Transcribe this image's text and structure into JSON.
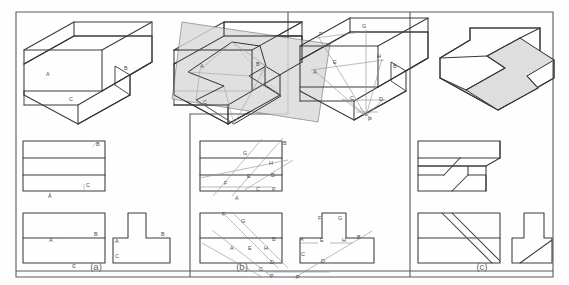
{
  "figure": {
    "header_note": "",
    "outer_frame_color": "#555555",
    "line_color": "#333333",
    "thin_line_color": "#8a8a8a",
    "cut_plane_fill": "#d8d8d8",
    "cut_face_fill": "#dedede",
    "label_color": "#4a4a4a"
  },
  "panels": [
    {
      "id": "a",
      "caption": "(a)"
    },
    {
      "id": "b",
      "caption": "(b)"
    },
    {
      "id": "c",
      "caption": "(c)"
    }
  ],
  "panel_a": {
    "caption": "(a)",
    "pictorial": {
      "name": "stepped-block-isometric",
      "labels": [
        {
          "text": "A",
          "x": 46,
          "y": 76
        },
        {
          "text": "B",
          "x": 124,
          "y": 70
        },
        {
          "text": "C",
          "x": 69,
          "y": 101
        }
      ]
    },
    "pictorial_with_plane": {
      "name": "stepped-block-with-cutting-plane",
      "labels": [
        {
          "text": "A",
          "x": 200,
          "y": 68
        },
        {
          "text": "B",
          "x": 256,
          "y": 66
        },
        {
          "text": "C",
          "x": 203,
          "y": 104
        },
        {
          "text": "D",
          "x": 232,
          "y": 105
        }
      ]
    },
    "top_view": {
      "name": "top-view",
      "labels": [
        {
          "text": "B",
          "x": 96,
          "y": 146
        },
        {
          "text": "C",
          "x": 87,
          "y": 187
        },
        {
          "text": "A",
          "x": 50,
          "y": 196
        }
      ]
    },
    "front_view": {
      "name": "front-view",
      "labels": [
        {
          "text": "B",
          "x": 94,
          "y": 229
        },
        {
          "text": "A",
          "x": 50,
          "y": 239
        },
        {
          "text": "C",
          "x": 74,
          "y": 265
        }
      ]
    },
    "side_view": {
      "name": "side-view",
      "labels": [
        {
          "text": "B",
          "x": 164,
          "y": 229
        },
        {
          "text": "A",
          "x": 117,
          "y": 238
        },
        {
          "text": "C",
          "x": 117,
          "y": 256
        }
      ]
    }
  },
  "panel_b": {
    "caption": "(b)",
    "pictorial": {
      "name": "stepped-block-isometric-with-trace-lines",
      "labels": [
        {
          "text": "F",
          "x": 321,
          "y": 35
        },
        {
          "text": "G",
          "x": 364,
          "y": 27
        },
        {
          "text": "E",
          "x": 334,
          "y": 62
        },
        {
          "text": "A",
          "x": 316,
          "y": 72
        },
        {
          "text": "H",
          "x": 379,
          "y": 57
        },
        {
          "text": "B",
          "x": 396,
          "y": 66
        },
        {
          "text": "C",
          "x": 353,
          "y": 98
        },
        {
          "text": "D",
          "x": 381,
          "y": 99
        },
        {
          "text": "P",
          "x": 366,
          "y": 118
        }
      ]
    },
    "top_view": {
      "name": "top-view",
      "labels": [
        {
          "text": "G",
          "x": 245,
          "y": 152
        },
        {
          "text": "B",
          "x": 285,
          "y": 142
        },
        {
          "text": "H",
          "x": 271,
          "y": 163
        },
        {
          "text": "E",
          "x": 249,
          "y": 176
        },
        {
          "text": "D",
          "x": 272,
          "y": 175
        },
        {
          "text": "F",
          "x": 227,
          "y": 183
        },
        {
          "text": "C",
          "x": 258,
          "y": 190
        },
        {
          "text": "P",
          "x": 274,
          "y": 190
        },
        {
          "text": "A",
          "x": 237,
          "y": 199
        }
      ]
    },
    "front_view": {
      "name": "front-view",
      "labels": [
        {
          "text": "F",
          "x": 224,
          "y": 214
        },
        {
          "text": "G",
          "x": 243,
          "y": 221
        },
        {
          "text": "B",
          "x": 274,
          "y": 239
        },
        {
          "text": "A",
          "x": 232,
          "y": 248
        },
        {
          "text": "E",
          "x": 250,
          "y": 248
        },
        {
          "text": "H",
          "x": 266,
          "y": 248
        },
        {
          "text": "D",
          "x": 272,
          "y": 262
        },
        {
          "text": "C",
          "x": 261,
          "y": 270
        },
        {
          "text": "P",
          "x": 272,
          "y": 277
        }
      ]
    },
    "side_view": {
      "name": "side-view",
      "labels": [
        {
          "text": "F",
          "x": 320,
          "y": 217
        },
        {
          "text": "G",
          "x": 340,
          "y": 217
        },
        {
          "text": "A",
          "x": 302,
          "y": 238
        },
        {
          "text": "E",
          "x": 322,
          "y": 239
        },
        {
          "text": "H",
          "x": 344,
          "y": 239
        },
        {
          "text": "B",
          "x": 359,
          "y": 236
        },
        {
          "text": "C",
          "x": 303,
          "y": 253
        },
        {
          "text": "D",
          "x": 323,
          "y": 260
        },
        {
          "text": "P",
          "x": 300,
          "y": 277
        }
      ]
    }
  },
  "panel_c": {
    "caption": "(c)",
    "pictorial": {
      "name": "cut-solid-isometric",
      "labels": []
    },
    "top_view": {
      "name": "top-view",
      "labels": []
    },
    "front_view": {
      "name": "front-view",
      "labels": []
    },
    "side_view": {
      "name": "side-view",
      "labels": []
    }
  }
}
